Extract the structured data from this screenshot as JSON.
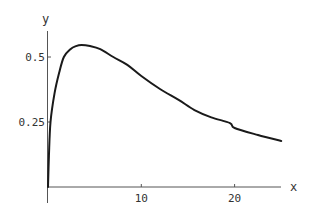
{
  "chart_data": {
    "type": "line",
    "title": "",
    "xlabel": "x",
    "ylabel": "y",
    "xlim": [
      0,
      25
    ],
    "ylim": [
      0,
      0.6
    ],
    "x_ticks": [
      10,
      20
    ],
    "x_tick_labels": [
      "10",
      "20"
    ],
    "y_ticks": [
      0.25,
      0.5
    ],
    "y_tick_labels": [
      "0.25",
      "0.5"
    ],
    "grid": false,
    "legend": null,
    "series": [
      {
        "name": "f(x)",
        "color": "#1a1a1a",
        "x": [
          0,
          0.1,
          0.27,
          0.7,
          1.2,
          1.7,
          2.4,
          3.0,
          3.6,
          4.5,
          5.6,
          7.0,
          8.5,
          10,
          12,
          14,
          15.7,
          17.5,
          19.5,
          20,
          22.5,
          25
        ],
        "y": [
          0,
          0.12,
          0.25,
          0.36,
          0.44,
          0.5,
          0.53,
          0.542,
          0.546,
          0.542,
          0.53,
          0.5,
          0.47,
          0.427,
          0.377,
          0.335,
          0.296,
          0.268,
          0.246,
          0.227,
          0.2,
          0.177
        ]
      }
    ]
  },
  "axes": {
    "x_label": "x",
    "y_label": "y",
    "x_ticks": [
      {
        "value": 10,
        "label": "10"
      },
      {
        "value": 20,
        "label": "20"
      }
    ],
    "y_ticks": [
      {
        "value": 0.25,
        "label": "0.25"
      },
      {
        "value": 0.5,
        "label": "0.5"
      }
    ]
  },
  "style": {
    "axis_color": "#555555",
    "curve_color": "#1a1a1a"
  }
}
